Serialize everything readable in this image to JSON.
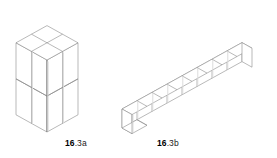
{
  "figure": {
    "background_color": "#ffffff",
    "stroke_color": "#8a8a8a",
    "stroke_color_dark": "#6f6f6f",
    "fill_color": "#ffffff",
    "shadow_color": "#c9c9c9",
    "label_color": "#1a1a1a"
  },
  "panels": [
    {
      "id": "16.3a",
      "label_number": "16",
      "label_suffix": ".3a",
      "shape_description": "rectangular block of unit cubes, 2 wide by 1 deep by 2 tall",
      "cube_count": 8,
      "dimensions": {
        "width": 2,
        "depth": 2,
        "height": 2
      },
      "top_face_cells": 4,
      "left_face_cells": 4,
      "right_face_cells": 4
    },
    {
      "id": "16.3b",
      "label_number": "16",
      "label_suffix": ".3b",
      "shape_description": "single row chain of unit cubes extending diagonally upward to the right",
      "cube_count": 8,
      "dimensions": {
        "width": 8,
        "depth": 1,
        "height": 1
      },
      "top_face_cells": 8,
      "front_face_cells": 8,
      "end_face_cells": 1
    }
  ],
  "labels": {
    "a": {
      "number": "16",
      "suffix": ".3a"
    },
    "b": {
      "number": "16",
      "suffix": ".3b"
    }
  },
  "geometry": {
    "iso_unit_x": 15.5,
    "iso_unit_y": 8.6,
    "iso_unit_z": 18.0,
    "panel_a_origin": {
      "x": 16,
      "y": 96
    },
    "panel_b_origin": {
      "x": 121,
      "y": 116
    }
  }
}
